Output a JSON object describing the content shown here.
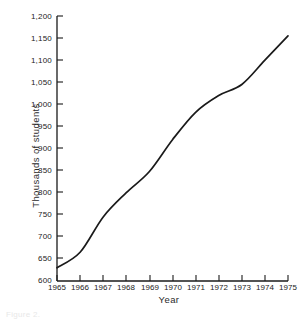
{
  "figure": {
    "caption": "Figure 2.",
    "background_color": "#ffffff",
    "line_color": "#1a1a1a",
    "axis_color": "#1a1a1a"
  },
  "chart_data": {
    "type": "line",
    "title": "",
    "subtitle": "",
    "xlabel": "Year",
    "ylabel": "Thousands of students",
    "xlim": [
      1965,
      1975
    ],
    "ylim": [
      600,
      1200
    ],
    "grid": false,
    "legend": false,
    "legend_position": "none",
    "x_tick_labels": [
      "1965",
      "1966",
      "1967",
      "1968",
      "1969",
      "1970",
      "1971",
      "1972",
      "1973",
      "1974",
      "1975"
    ],
    "y_tick_labels": [
      "600",
      "650",
      "700",
      "750",
      "800",
      "850",
      "900",
      "950",
      "1,000",
      "1,050",
      "1,100",
      "1,150",
      "1,200"
    ],
    "y_ticks": [
      600,
      650,
      700,
      750,
      800,
      850,
      900,
      950,
      1000,
      1050,
      1100,
      1150,
      1200
    ],
    "x": [
      1965,
      1966,
      1967,
      1968,
      1969,
      1970,
      1971,
      1972,
      1973,
      1974,
      1975
    ],
    "values": [
      630,
      665,
      745,
      800,
      848,
      920,
      982,
      1020,
      1045,
      1100,
      1155
    ],
    "series": [
      {
        "name": "Enrollment",
        "values": [
          630,
          665,
          745,
          800,
          848,
          920,
          982,
          1020,
          1045,
          1100,
          1155
        ]
      }
    ],
    "annotations": []
  },
  "axes": {
    "x_title": "Year",
    "y_title": "Thousands of students"
  }
}
